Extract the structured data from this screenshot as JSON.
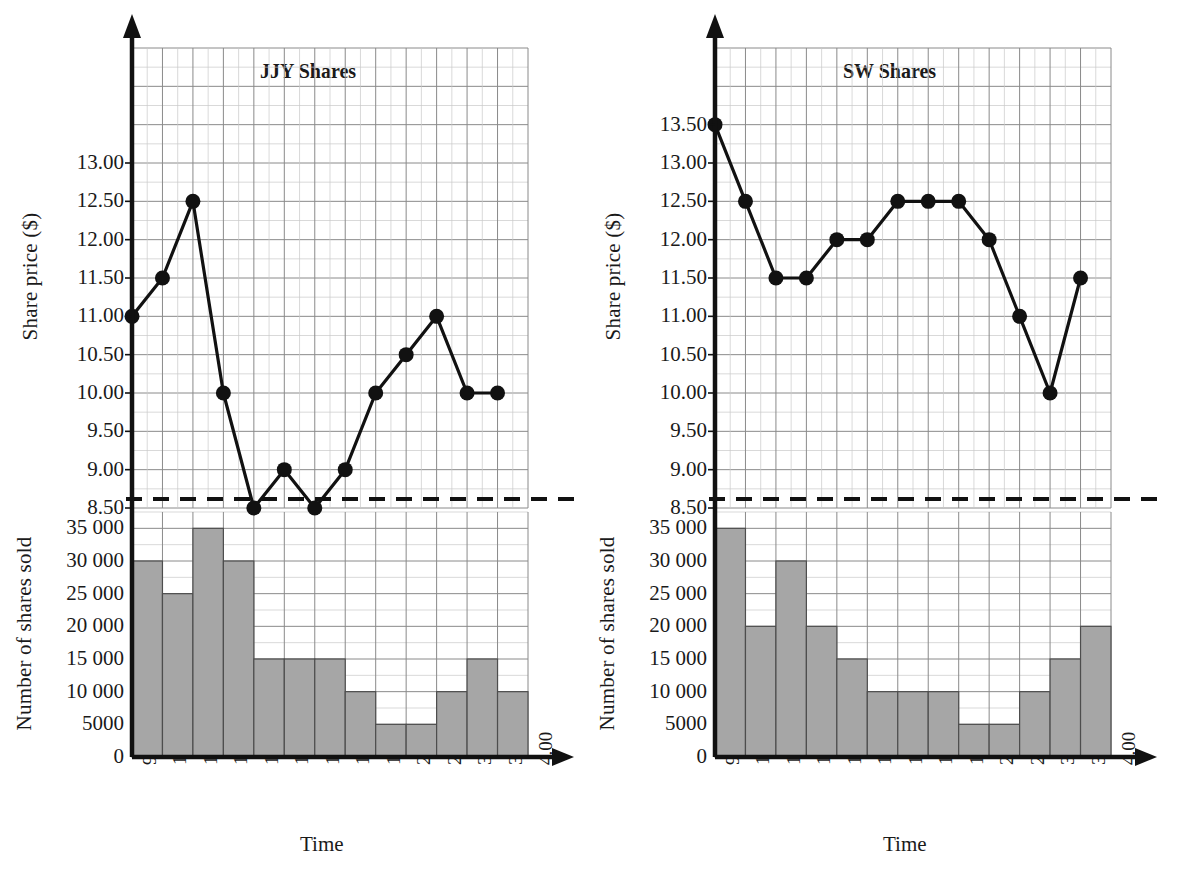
{
  "figure": {
    "axis_color": "#111111",
    "grid_major_color": "#8a8a8a",
    "grid_minor_color": "#c9c9c9",
    "bar_fill": "#a6a6a6",
    "bar_stroke": "#4d4d4d",
    "line_color": "#111111",
    "marker_color": "#111111"
  },
  "chart_data": [
    {
      "type": "line",
      "panel": "left",
      "title": "JJY Shares",
      "xlabel": "Time",
      "ylabel": "Share price ($)",
      "categories": [
        "9.30",
        "10.00",
        "10.30",
        "11.00",
        "11.30",
        "12.00",
        "12.30",
        "1.00",
        "1.30",
        "2.00",
        "2.30",
        "3.00",
        "3.30",
        "4.00"
      ],
      "values": [
        11.0,
        11.5,
        12.5,
        10.0,
        8.5,
        9.0,
        8.5,
        9.0,
        10.0,
        10.5,
        11.0,
        10.0,
        10.0,
        null
      ],
      "yticks": [
        "13.00",
        "12.50",
        "12.00",
        "11.50",
        "11.00",
        "10.50",
        "10.00",
        "9.50",
        "9.00",
        "8.50"
      ],
      "ytick_values": [
        13.0,
        12.5,
        12.0,
        11.5,
        11.0,
        10.5,
        10.0,
        9.5,
        9.0,
        8.5
      ],
      "ylim": [
        8.5,
        14.5
      ],
      "grid": true,
      "legend": "none"
    },
    {
      "type": "bar",
      "panel": "left",
      "xlabel": "Time",
      "ylabel": "Number of shares sold",
      "categories": [
        "9.30",
        "10.00",
        "10.30",
        "11.00",
        "11.30",
        "12.00",
        "12.30",
        "1.00",
        "1.30",
        "2.00",
        "2.30",
        "3.00",
        "3.30",
        "4.00"
      ],
      "values": [
        30000,
        25000,
        35000,
        30000,
        15000,
        15000,
        15000,
        10000,
        5000,
        5000,
        10000,
        15000,
        10000
      ],
      "yticks": [
        "35 000",
        "30 000",
        "25 000",
        "20 000",
        "15 000",
        "10 000",
        "5000",
        "0"
      ],
      "ytick_values": [
        35000,
        30000,
        25000,
        20000,
        15000,
        10000,
        5000,
        0
      ],
      "ylim": [
        0,
        37500
      ],
      "grid": true,
      "legend": "none"
    },
    {
      "type": "line",
      "panel": "right",
      "title": "SW Shares",
      "xlabel": "Time",
      "ylabel": "Share price ($)",
      "categories": [
        "9.30",
        "10.00",
        "10.30",
        "11.00",
        "11.30",
        "12.00",
        "12.30",
        "1.00",
        "1.30",
        "2.00",
        "2.30",
        "3.00",
        "3.30",
        "4.00"
      ],
      "values": [
        13.5,
        12.5,
        11.5,
        11.5,
        12.0,
        12.0,
        12.5,
        12.5,
        12.5,
        12.0,
        11.0,
        10.0,
        11.5,
        null
      ],
      "yticks": [
        "13.50",
        "13.00",
        "12.50",
        "12.00",
        "11.50",
        "11.00",
        "10.50",
        "10.00",
        "9.50",
        "9.00",
        "8.50"
      ],
      "ytick_values": [
        13.5,
        13.0,
        12.5,
        12.0,
        11.5,
        11.0,
        10.5,
        10.0,
        9.5,
        9.0,
        8.5
      ],
      "ylim": [
        8.5,
        14.5
      ],
      "grid": true,
      "legend": "none"
    },
    {
      "type": "bar",
      "panel": "right",
      "xlabel": "Time",
      "ylabel": "Number of shares sold",
      "categories": [
        "9.30",
        "10.00",
        "10.30",
        "11.00",
        "11.30",
        "12.00",
        "12.30",
        "1.00",
        "1.30",
        "2.00",
        "2.30",
        "3.00",
        "3.30",
        "4.00"
      ],
      "values": [
        35000,
        20000,
        30000,
        20000,
        15000,
        10000,
        10000,
        10000,
        5000,
        5000,
        10000,
        15000,
        20000
      ],
      "yticks": [
        "35 000",
        "30 000",
        "25 000",
        "20 000",
        "15 000",
        "10 000",
        "5000",
        "0"
      ],
      "ytick_values": [
        35000,
        30000,
        25000,
        20000,
        15000,
        10000,
        5000,
        0
      ],
      "ylim": [
        0,
        37500
      ],
      "grid": true,
      "legend": "none"
    }
  ],
  "left_panel": {
    "title": "JJY Shares",
    "price_ylabel": "Share price ($)",
    "volume_ylabel": "Number of shares sold",
    "xaxis_name": "Time"
  },
  "right_panel": {
    "title": "SW Shares",
    "price_ylabel": "Share price ($)",
    "volume_ylabel": "Number of shares sold",
    "xaxis_name": "Time"
  }
}
